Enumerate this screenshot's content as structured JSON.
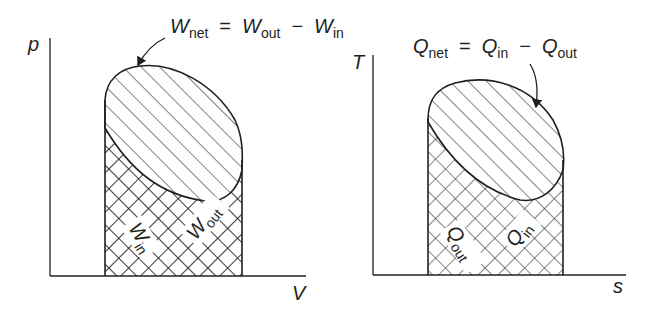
{
  "colors": {
    "ink": "#231f20",
    "background": "#ffffff"
  },
  "left_diagram": {
    "type": "p-V diagram",
    "y_axis_label": "p",
    "x_axis_label": "V",
    "equation": {
      "lhs": "W",
      "lhs_sub": "net",
      "eq": "=",
      "t1": "W",
      "t1_sub": "out",
      "minus": "−",
      "t2": "W",
      "t2_sub": "in"
    },
    "region_labels": [
      {
        "main": "W",
        "sub": "in"
      },
      {
        "main": "W",
        "sub": "out"
      }
    ]
  },
  "right_diagram": {
    "type": "T-s diagram",
    "y_axis_label": "T",
    "x_axis_label": "s",
    "equation": {
      "lhs": "Q",
      "lhs_sub": "net",
      "eq": "=",
      "t1": "Q",
      "t1_sub": "in",
      "minus": "−",
      "t2": "Q",
      "t2_sub": "out"
    },
    "region_labels": [
      {
        "main": "Q",
        "sub": "out"
      },
      {
        "main": "Q",
        "sub": "in"
      }
    ]
  }
}
